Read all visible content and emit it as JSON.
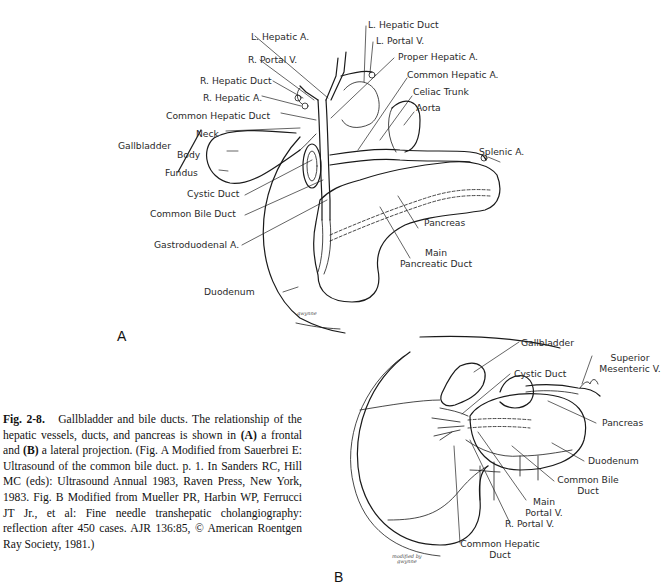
{
  "figure": {
    "number": "Fig. 2-8.",
    "title": "Gallbladder and bile ducts.",
    "caption_parts": {
      "p1": " The relationship of the hepatic vessels, ducts, and pancreas is shown in ",
      "a": "(A)",
      "p2": " a frontal and ",
      "b": "(B)",
      "p3": " a lateral projection. (Fig. A Modified from Sauerbrei E: Ultrasound of the common bile duct. p. 1. In Sanders RC, Hill MC (eds): Ultrasound Annual 1983, Raven Press, New York, 1983. Fig. B Modified from Mueller PR, Harbin WP, Ferrucci JT Jr., et al: Fine needle transhepatic cholangiography: reflection after 450 cases. AJR 136:85, © American Roentgen Ray Society, 1981.)"
    }
  },
  "panel_a": {
    "letter": "A",
    "signature": "gwynne",
    "labels": {
      "l_hepatic_a": "L. Hepatic A.",
      "r_portal_v": "R. Portal V.",
      "r_hepatic_duct": "R. Hepatic Duct",
      "r_hepatic_a": "R. Hepatic A.",
      "common_hepatic_duct": "Common Hepatic Duct",
      "neck": "Neck",
      "gallbladder": "Gallbladder",
      "body": "Body",
      "fundus": "Fundus",
      "cystic_duct": "Cystic Duct",
      "common_bile_duct": "Common Bile Duct",
      "gastroduodenal_a": "Gastroduodenal A.",
      "duodenum": "Duodenum",
      "l_hepatic_duct": "L. Hepatic Duct",
      "l_portal_v": "L. Portal V.",
      "proper_hepatic_a": "Proper Hepatic A.",
      "common_hepatic_a": "Common Hepatic A.",
      "celiac_trunk": "Celiac Trunk",
      "aorta": "Aorta",
      "splenic_a": "Splenic A.",
      "pancreas": "Pancreas",
      "main_pancreatic_duct_1": "Main",
      "main_pancreatic_duct_2": "Pancreatic Duct"
    }
  },
  "panel_b": {
    "letter": "B",
    "signature_1": "modified by",
    "signature_2": "gwynne",
    "labels": {
      "gallbladder": "Gallbladder",
      "superior_mesenteric_v_1": "Superior",
      "superior_mesenteric_v_2": "Mesenteric V.",
      "cystic_duct": "Cystic Duct",
      "pancreas": "Pancreas",
      "duodenum": "Duodenum",
      "common_bile_duct_1": "Common Bile",
      "common_bile_duct_2": "Duct",
      "main_portal_v_1": "Main",
      "main_portal_v_2": "Portal V.",
      "r_portal_v": "R. Portal V.",
      "common_hepatic_duct_1": "Common Hepatic",
      "common_hepatic_duct_2": "Duct"
    }
  }
}
